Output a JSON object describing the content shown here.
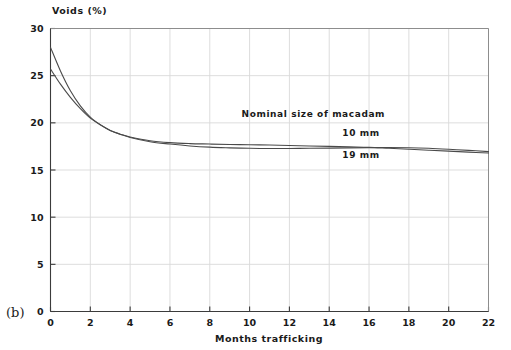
{
  "figure": {
    "panel_label": "(b)"
  },
  "chart_data": {
    "type": "line",
    "title": "",
    "ylabel": "Voids (%)",
    "xlabel": "Months trafficking",
    "xlim": [
      0,
      22
    ],
    "ylim": [
      0,
      30
    ],
    "xticks": [
      0,
      2,
      4,
      6,
      8,
      10,
      12,
      14,
      16,
      18,
      20,
      22
    ],
    "yticks": [
      0,
      5,
      10,
      15,
      20,
      25,
      30
    ],
    "grid": true,
    "legend_position": "inside-right",
    "legend_title": "Nominal size of macadam",
    "annotations": [
      {
        "text": "Nominal size of macadam",
        "x": 13.2,
        "y": 20.6
      },
      {
        "text": "10 mm",
        "x": 15.6,
        "y": 18.6
      },
      {
        "text": "19 mm",
        "x": 15.6,
        "y": 16.3
      }
    ],
    "series": [
      {
        "name": "10 mm",
        "x": [
          0,
          0.5,
          1,
          1.5,
          2,
          2.5,
          3,
          3.5,
          4,
          5,
          6,
          7,
          8,
          9,
          10,
          11,
          12,
          13,
          14,
          15,
          16,
          17,
          18,
          19,
          20,
          21,
          22
        ],
        "values": [
          28.0,
          25.5,
          23.4,
          21.8,
          20.6,
          19.8,
          19.2,
          18.8,
          18.5,
          18.1,
          17.9,
          17.8,
          17.75,
          17.7,
          17.68,
          17.65,
          17.6,
          17.55,
          17.5,
          17.45,
          17.4,
          17.3,
          17.2,
          17.1,
          17.0,
          16.9,
          16.8
        ]
      },
      {
        "name": "19 mm",
        "x": [
          0,
          0.5,
          1,
          1.5,
          2,
          2.5,
          3,
          3.5,
          4,
          5,
          6,
          7,
          8,
          9,
          10,
          11,
          12,
          13,
          14,
          15,
          16,
          17,
          18,
          19,
          20,
          21,
          22
        ],
        "values": [
          25.7,
          24.1,
          22.7,
          21.5,
          20.5,
          19.8,
          19.2,
          18.8,
          18.45,
          18.0,
          17.75,
          17.55,
          17.42,
          17.35,
          17.3,
          17.28,
          17.28,
          17.3,
          17.32,
          17.35,
          17.37,
          17.38,
          17.36,
          17.3,
          17.2,
          17.08,
          16.95
        ]
      }
    ]
  }
}
